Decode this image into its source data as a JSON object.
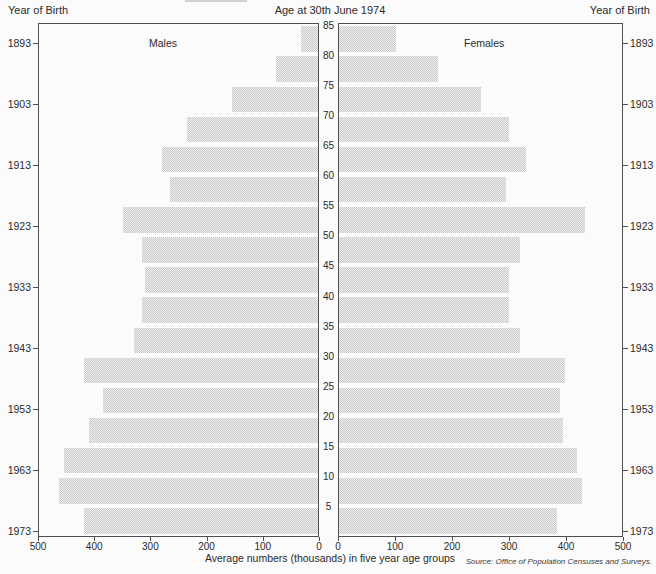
{
  "header": {
    "title": "Age at 30th June 1974",
    "left_axis_title": "Year of Birth",
    "right_axis_title": "Year of Birth"
  },
  "labels": {
    "males": "Males",
    "females": "Females"
  },
  "footer": {
    "xaxis_label": "Average numbers (thousands) in five year age groups",
    "source": "Source: Office of Population Censuses and Surveys."
  },
  "chart_data": {
    "type": "bar",
    "variant": "population-pyramid",
    "title": "Age at 30th June 1974",
    "xlabel": "Average numbers (thousands) in five year age groups",
    "age_axis": {
      "label_position": "center",
      "tick_labels": [
        5,
        10,
        15,
        20,
        25,
        30,
        35,
        40,
        45,
        50,
        55,
        60,
        65,
        70,
        75,
        80,
        85
      ]
    },
    "value_axis": {
      "min": 0,
      "max": 500,
      "ticks": [
        0,
        100,
        200,
        300,
        400,
        500
      ]
    },
    "year_of_birth_ticks": [
      1893,
      1903,
      1913,
      1923,
      1933,
      1943,
      1953,
      1963,
      1973
    ],
    "age_groups_bottom_to_top": [
      "0-4",
      "5-9",
      "10-14",
      "15-19",
      "20-24",
      "25-29",
      "30-34",
      "35-39",
      "40-44",
      "45-49",
      "50-54",
      "55-59",
      "60-64",
      "65-69",
      "70-74",
      "75-79",
      "80-84"
    ],
    "series": [
      {
        "name": "Males",
        "values": [
          420,
          465,
          455,
          410,
          385,
          420,
          330,
          315,
          310,
          315,
          350,
          265,
          280,
          235,
          155,
          75,
          30
        ]
      },
      {
        "name": "Females",
        "values": [
          385,
          430,
          420,
          395,
          390,
          400,
          320,
          300,
          300,
          320,
          435,
          295,
          330,
          300,
          250,
          175,
          100
        ]
      }
    ],
    "bar_color": "#d7d7d7",
    "grid": false,
    "legend_position": "none"
  }
}
